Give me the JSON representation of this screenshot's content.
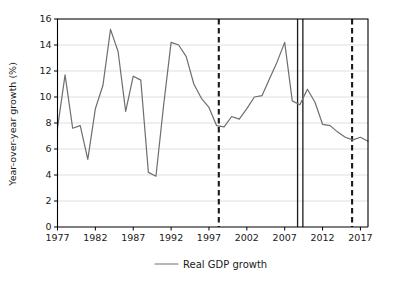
{
  "chart_data": {
    "type": "line",
    "title": "",
    "subtitle": "",
    "xlabel": "",
    "ylabel": "Year-over-year growth (%)",
    "xlim": [
      1977,
      2018
    ],
    "ylim": [
      0,
      16
    ],
    "yticks": [
      0,
      2,
      4,
      6,
      8,
      10,
      12,
      14,
      16
    ],
    "xticks": [
      1977,
      1982,
      1987,
      1992,
      1997,
      2002,
      2007,
      2012,
      2017
    ],
    "grid": "horizontal",
    "legend_position": "bottom-center",
    "series": [
      {
        "name": "Real GDP growth",
        "color": "#6e6e6e",
        "x": [
          1977,
          1978,
          1979,
          1980,
          1981,
          1982,
          1983,
          1984,
          1985,
          1986,
          1987,
          1988,
          1989,
          1990,
          1991,
          1992,
          1993,
          1994,
          1995,
          1996,
          1997,
          1998,
          1999,
          2000,
          2001,
          2002,
          2003,
          2004,
          2005,
          2006,
          2007,
          2008,
          2009,
          2010,
          2011,
          2012,
          2013,
          2014,
          2015,
          2016,
          2017,
          2018
        ],
        "values": [
          7.6,
          11.7,
          7.6,
          7.8,
          5.2,
          9.1,
          10.9,
          15.2,
          13.5,
          8.9,
          11.6,
          11.3,
          4.2,
          3.9,
          9.3,
          14.2,
          14.0,
          13.1,
          11.0,
          9.9,
          9.2,
          7.8,
          7.7,
          8.5,
          8.3,
          9.1,
          10.0,
          10.1,
          11.4,
          12.7,
          14.2,
          9.7,
          9.4,
          10.6,
          9.6,
          7.9,
          7.8,
          7.3,
          6.9,
          6.7,
          6.9,
          6.6
        ]
      }
    ],
    "vertical_markers": [
      {
        "name": "marker-1998-dashed",
        "x": 1998.3,
        "style": "dashed",
        "color": "#1a1a1a"
      },
      {
        "name": "marker-2009-solid",
        "x": 2008.7,
        "style": "solid",
        "color": "#1a1a1a"
      },
      {
        "name": "marker-2010-solid",
        "x": 2009.4,
        "style": "solid",
        "color": "#1a1a1a"
      },
      {
        "name": "marker-2016-dashed",
        "x": 2015.9,
        "style": "dashed",
        "color": "#1a1a1a"
      }
    ]
  },
  "legend": {
    "entries": [
      {
        "label": "Real GDP growth",
        "color": "#6e6e6e"
      }
    ]
  },
  "axis": {
    "y_title": "Year-over-year growth (%)",
    "y_tick_labels": [
      "0",
      "2",
      "4",
      "6",
      "8",
      "10",
      "12",
      "14",
      "16"
    ],
    "x_tick_labels": [
      "1977",
      "1982",
      "1987",
      "1992",
      "1997",
      "2002",
      "2007",
      "2012",
      "2017"
    ]
  },
  "colors": {
    "series": "#6e6e6e",
    "grid": "#c9c9c9",
    "axis": "#000000",
    "text": "#1a1a1a",
    "background": "#ffffff"
  }
}
